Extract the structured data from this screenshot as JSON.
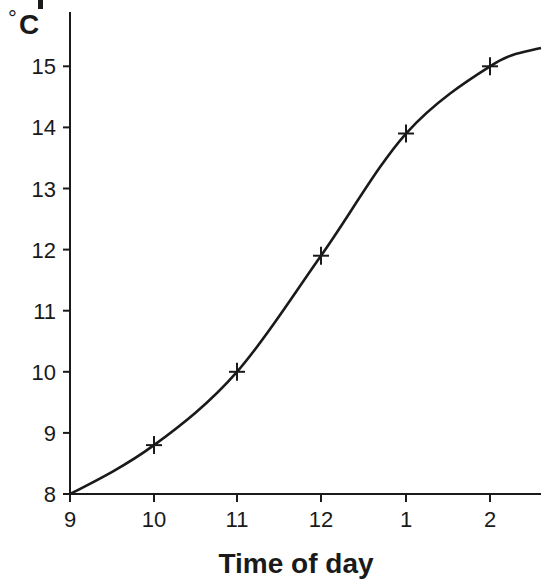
{
  "chart_data": {
    "type": "line",
    "title_visible_fragment": "p",
    "xlabel": "Time of day",
    "ylabel": "°C",
    "categories": [
      "9",
      "10",
      "11",
      "12",
      "1",
      "2"
    ],
    "x_ticks": [
      "9",
      "10",
      "11",
      "12",
      "1",
      "2"
    ],
    "y_ticks": [
      8,
      9,
      10,
      11,
      12,
      13,
      14,
      15
    ],
    "ylim": [
      8,
      15.8
    ],
    "grid": false,
    "legend": null,
    "series": [
      {
        "name": "Temperature",
        "marker": "plus",
        "smooth": true,
        "points": [
          {
            "x": "9",
            "y": 8.0
          },
          {
            "x": "10",
            "y": 8.8
          },
          {
            "x": "11",
            "y": 10.0
          },
          {
            "x": "12",
            "y": 11.9
          },
          {
            "x": "1",
            "y": 13.9
          },
          {
            "x": "2",
            "y": 15.0
          }
        ],
        "values": [
          8.0,
          8.8,
          10.0,
          11.9,
          13.9,
          15.0
        ],
        "curve_end_value": 15.3
      }
    ]
  },
  "labels": {
    "unit_degree": "°",
    "unit_letter": "C",
    "x_axis_title": "Time of day",
    "title_fragment": "p"
  },
  "colors": {
    "ink": "#1a1a1a",
    "background": "#ffffff"
  }
}
